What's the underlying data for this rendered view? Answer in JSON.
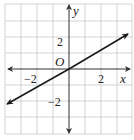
{
  "figure": {
    "type": "coordinate-plane",
    "x_axis_label": "x",
    "y_axis_label": "y",
    "origin_label": "O",
    "tick_labels": {
      "x_pos": "2",
      "x_neg": "−2",
      "y_pos": "2",
      "y_neg": "−2"
    },
    "grid": {
      "x_range": [
        -4,
        4
      ],
      "y_range": [
        -4,
        4
      ],
      "step": 1
    },
    "line": {
      "description": "line through origin with slope 1/2",
      "slope": 0.5,
      "intercept": 0,
      "arrows": "both"
    },
    "colors": {
      "grid": "#c8c8c8",
      "axis": "#333333",
      "line": "#1a1a1a",
      "background": "#ffffff"
    }
  }
}
